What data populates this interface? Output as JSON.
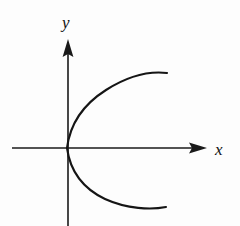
{
  "figure": {
    "background_color": "#fdfdfd",
    "ink_color": "#151515",
    "width": 240,
    "height": 226
  },
  "axes": {
    "x_axis": {
      "label": "x",
      "label_x": 215,
      "label_y": 155,
      "line_start_x": 12,
      "line_end_x": 196,
      "y": 148,
      "arrow_tip_x": 207,
      "arrow_direction": "right"
    },
    "y_axis": {
      "label": "y",
      "label_x": 62,
      "label_y": 28,
      "x": 68,
      "line_start_y": 226,
      "line_end_y": 52,
      "arrow_tip_y": 39,
      "arrow_direction": "up"
    },
    "origin": {
      "x": 67,
      "y": 148
    }
  },
  "chart_data": {
    "type": "line",
    "title": "",
    "subtitle": "",
    "xlabel": "x",
    "ylabel": "y",
    "grid": false,
    "legend": "none",
    "axis_arrows": true,
    "origin_pixel": {
      "x": 67,
      "y": 148
    },
    "curve_equation": "x = a*y^2  (sideways parabola opening to the right)",
    "xlim": [
      0,
      100
    ],
    "ylim": [
      -75,
      75
    ],
    "series": [
      {
        "name": "upper-branch",
        "path": "M 67 148 C 70 124 84 104 106 90 C 128 76 150 71 167 73",
        "start_pixel": {
          "x": 67,
          "y": 148
        },
        "end_pixel": {
          "x": 167,
          "y": 73
        },
        "x": [
          0,
          3,
          17,
          39,
          61,
          83,
          100
        ],
        "y": [
          0,
          24,
          44,
          58,
          68,
          73,
          75
        ]
      },
      {
        "name": "lower-branch",
        "path": "M 67 148 C 70 170 82 188 105 199 C 127 209 151 210 166 207",
        "start_pixel": {
          "x": 67,
          "y": 148
        },
        "end_pixel": {
          "x": 166,
          "y": 207
        },
        "x": [
          0,
          3,
          15,
          38,
          60,
          84,
          99
        ],
        "y": [
          0,
          -22,
          -40,
          -51,
          -59,
          -61,
          -59
        ]
      }
    ]
  }
}
